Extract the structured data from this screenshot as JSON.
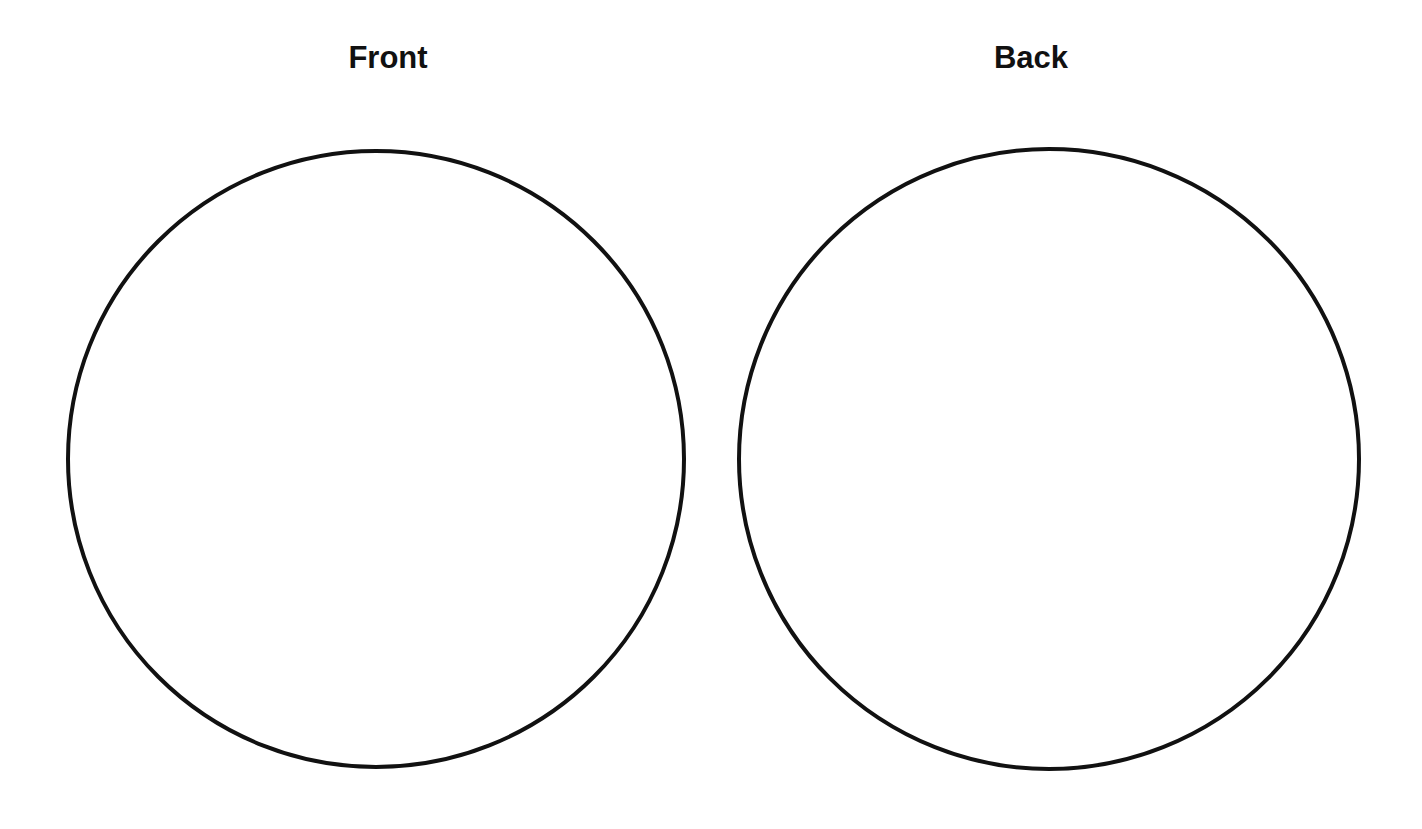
{
  "panels": [
    {
      "title": "Front",
      "circle": {
        "cx": 376,
        "cy": 459,
        "r": 308
      }
    },
    {
      "title": "Back",
      "circle": {
        "cx": 1049,
        "cy": 459,
        "r": 310
      }
    }
  ],
  "colors": {
    "stroke": "#111111",
    "background": "#ffffff"
  }
}
